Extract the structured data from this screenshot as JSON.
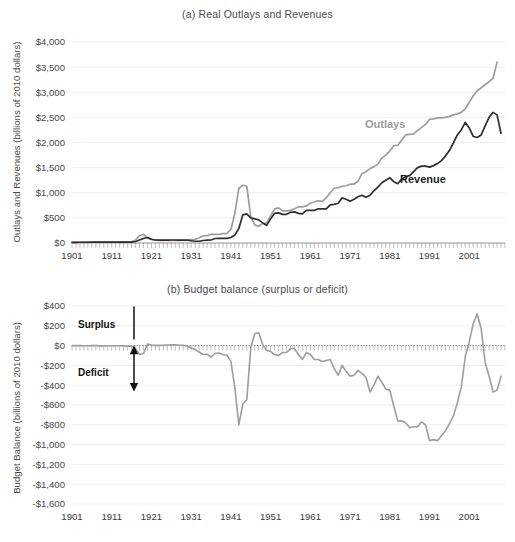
{
  "figure": {
    "panel_a_title": "(a) Real Outlays and Revenues",
    "panel_b_title": "(b) Budget balance (surplus or deficit)",
    "panel_a_ylabel": "Outlays and Revenues (billions of 2010 dollars)",
    "panel_b_ylabel": "Budget Balance (billions of 2010 dollars)",
    "series_label_outlays": "Outlays",
    "series_label_revenue": "Revenue",
    "annotation_surplus": "Surplus",
    "annotation_deficit": "Deficit",
    "color_outlays": "#9d9d9d",
    "color_revenue": "#2f2f2f",
    "color_balance": "#9d9d9d",
    "color_grid": "#eeeeee",
    "color_axis": "#9a9a9a"
  },
  "chart_data": [
    {
      "type": "line",
      "title": "(a) Real Outlays and Revenues",
      "xlabel": "",
      "ylabel": "Outlays and Revenues (billions of 2010 dollars)",
      "xlim": [
        1901,
        2010
      ],
      "ylim": [
        0,
        4000
      ],
      "ytick_labels": [
        "$0",
        "$500",
        "$1,000",
        "$1,500",
        "$2,000",
        "$2,500",
        "$3,000",
        "$3,500",
        "$4,000"
      ],
      "ytick_values": [
        0,
        500,
        1000,
        1500,
        2000,
        2500,
        3000,
        3500,
        4000
      ],
      "xtick_labels": [
        "1901",
        "1911",
        "1921",
        "1931",
        "1941",
        "1951",
        "1961",
        "1971",
        "1981",
        "1991",
        "2001"
      ],
      "xtick_values": [
        1901,
        1911,
        1921,
        1931,
        1941,
        1951,
        1961,
        1971,
        1981,
        1991,
        2001
      ],
      "grid": true,
      "legend": "inline-annotations",
      "x": [
        1901,
        1902,
        1903,
        1904,
        1905,
        1906,
        1907,
        1908,
        1909,
        1910,
        1911,
        1912,
        1913,
        1914,
        1915,
        1916,
        1917,
        1918,
        1919,
        1920,
        1921,
        1922,
        1923,
        1924,
        1925,
        1926,
        1927,
        1928,
        1929,
        1930,
        1931,
        1932,
        1933,
        1934,
        1935,
        1936,
        1937,
        1938,
        1939,
        1940,
        1941,
        1942,
        1943,
        1944,
        1945,
        1946,
        1947,
        1948,
        1949,
        1950,
        1951,
        1952,
        1953,
        1954,
        1955,
        1956,
        1957,
        1958,
        1959,
        1960,
        1961,
        1962,
        1963,
        1964,
        1965,
        1966,
        1967,
        1968,
        1969,
        1970,
        1971,
        1972,
        1973,
        1974,
        1975,
        1976,
        1977,
        1978,
        1979,
        1980,
        1981,
        1982,
        1983,
        1984,
        1985,
        1986,
        1987,
        1988,
        1989,
        1990,
        1991,
        1992,
        1993,
        1994,
        1995,
        1996,
        1997,
        1998,
        1999,
        2000,
        2001,
        2002,
        2003,
        2004,
        2005,
        2006,
        2007,
        2008,
        2009
      ],
      "series": [
        {
          "name": "Outlays",
          "color": "#9d9d9d",
          "values": [
            14,
            14,
            15,
            16,
            16,
            16,
            17,
            19,
            20,
            20,
            20,
            20,
            21,
            22,
            24,
            24,
            60,
            150,
            170,
            95,
            70,
            58,
            54,
            52,
            52,
            52,
            52,
            54,
            55,
            60,
            70,
            75,
            100,
            140,
            145,
            175,
            170,
            170,
            185,
            190,
            270,
            590,
            1090,
            1150,
            1130,
            520,
            360,
            330,
            390,
            400,
            540,
            680,
            700,
            640,
            640,
            650,
            680,
            720,
            720,
            740,
            790,
            820,
            840,
            830,
            900,
            1000,
            1090,
            1100,
            1130,
            1140,
            1170,
            1170,
            1230,
            1380,
            1420,
            1480,
            1520,
            1570,
            1690,
            1750,
            1830,
            1940,
            1940,
            2050,
            2150,
            2160,
            2170,
            2240,
            2300,
            2360,
            2460,
            2470,
            2490,
            2490,
            2500,
            2520,
            2550,
            2570,
            2600,
            2670,
            2800,
            2930,
            3030,
            3090,
            3150,
            3210,
            3280,
            3600
          ]
        },
        {
          "name": "Revenue",
          "color": "#2f2f2f",
          "values": [
            14,
            14,
            15,
            15,
            15,
            16,
            17,
            16,
            17,
            18,
            18,
            18,
            19,
            19,
            18,
            19,
            30,
            60,
            90,
            110,
            75,
            60,
            56,
            56,
            58,
            60,
            60,
            58,
            58,
            56,
            45,
            35,
            35,
            50,
            58,
            60,
            90,
            95,
            92,
            92,
            110,
            160,
            290,
            560,
            580,
            500,
            480,
            460,
            400,
            350,
            480,
            590,
            600,
            570,
            570,
            610,
            620,
            590,
            580,
            650,
            650,
            650,
            680,
            680,
            680,
            760,
            770,
            790,
            900,
            870,
            830,
            870,
            920,
            950,
            910,
            950,
            1040,
            1110,
            1200,
            1250,
            1300,
            1220,
            1180,
            1270,
            1320,
            1340,
            1420,
            1500,
            1530,
            1530,
            1510,
            1540,
            1580,
            1640,
            1730,
            1840,
            1990,
            2150,
            2250,
            2400,
            2290,
            2120,
            2100,
            2150,
            2330,
            2500,
            2600,
            2550,
            2180
          ]
        }
      ]
    },
    {
      "type": "line",
      "title": "(b) Budget balance (surplus or deficit)",
      "xlabel": "",
      "ylabel": "Budget Balance (billions of 2010 dollars)",
      "xlim": [
        1901,
        2010
      ],
      "ylim": [
        -1600,
        400
      ],
      "ytick_labels": [
        "$400",
        "$200",
        "$0",
        "-$200",
        "-$400",
        "-$600",
        "-$800",
        "-$1,000",
        "-$1,200",
        "-$1,400",
        "-$1,600"
      ],
      "ytick_values": [
        400,
        200,
        0,
        -200,
        -400,
        -600,
        -800,
        -1000,
        -1200,
        -1400,
        -1600
      ],
      "xtick_labels": [
        "1901",
        "1911",
        "1921",
        "1931",
        "1941",
        "1951",
        "1961",
        "1971",
        "1981",
        "1991",
        "2001"
      ],
      "xtick_values": [
        1901,
        1911,
        1921,
        1931,
        1941,
        1951,
        1961,
        1971,
        1981,
        1991,
        2001
      ],
      "grid": true,
      "zero_reference": 0,
      "annotations": [
        {
          "text": "Surplus",
          "direction": "up"
        },
        {
          "text": "Deficit",
          "direction": "down"
        }
      ],
      "x": [
        1901,
        1902,
        1903,
        1904,
        1905,
        1906,
        1907,
        1908,
        1909,
        1910,
        1911,
        1912,
        1913,
        1914,
        1915,
        1916,
        1917,
        1918,
        1919,
        1920,
        1921,
        1922,
        1923,
        1924,
        1925,
        1926,
        1927,
        1928,
        1929,
        1930,
        1931,
        1932,
        1933,
        1934,
        1935,
        1936,
        1937,
        1938,
        1939,
        1940,
        1941,
        1942,
        1943,
        1944,
        1945,
        1946,
        1947,
        1948,
        1949,
        1950,
        1951,
        1952,
        1953,
        1954,
        1955,
        1956,
        1957,
        1958,
        1959,
        1960,
        1961,
        1962,
        1963,
        1964,
        1965,
        1966,
        1967,
        1968,
        1969,
        1970,
        1971,
        1972,
        1973,
        1974,
        1975,
        1976,
        1977,
        1978,
        1979,
        1980,
        1981,
        1982,
        1983,
        1984,
        1985,
        1986,
        1987,
        1988,
        1989,
        1990,
        1991,
        1992,
        1993,
        1994,
        1995,
        1996,
        1997,
        1998,
        1999,
        2000,
        2001,
        2002,
        2003,
        2004,
        2005,
        2006,
        2007,
        2008,
        2009
      ],
      "series": [
        {
          "name": "Budget Balance",
          "color": "#9d9d9d",
          "values": [
            0,
            0,
            0,
            -1,
            -1,
            0,
            0,
            -3,
            -3,
            -2,
            -2,
            -2,
            -2,
            -3,
            -6,
            -5,
            -30,
            -90,
            -80,
            15,
            5,
            2,
            2,
            4,
            6,
            8,
            8,
            4,
            3,
            -4,
            -25,
            -40,
            -65,
            -90,
            -87,
            -115,
            -80,
            -75,
            -93,
            -98,
            -160,
            -430,
            -800,
            -590,
            -550,
            -20,
            120,
            130,
            10,
            -50,
            -60,
            -90,
            -100,
            -70,
            -70,
            -30,
            -30,
            -90,
            -140,
            -70,
            -90,
            -140,
            -140,
            -160,
            -150,
            -140,
            -230,
            -300,
            -200,
            -260,
            -310,
            -300,
            -250,
            -280,
            -320,
            -470,
            -400,
            -310,
            -370,
            -440,
            -450,
            -610,
            -760,
            -760,
            -780,
            -830,
            -820,
            -820,
            -770,
            -800,
            -960,
            -950,
            -960,
            -910,
            -860,
            -790,
            -710,
            -580,
            -420,
            -110,
            40,
            220,
            320,
            170,
            -170,
            -310,
            -470,
            -450,
            -310,
            -170,
            -400,
            -1420
          ]
        }
      ]
    }
  ]
}
